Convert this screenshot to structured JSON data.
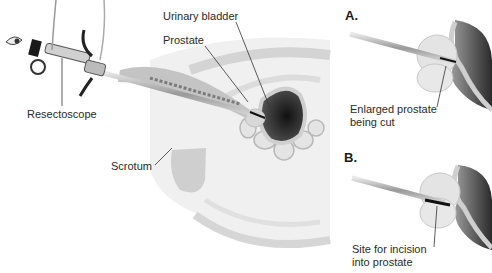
{
  "figure": {
    "main_view": {
      "labels": {
        "urinary_bladder": "Urinary bladder",
        "prostate": "Prostate",
        "resectoscope": "Resectoscope",
        "scrotum": "Scrotum"
      }
    },
    "panel_a": {
      "letter": "A.",
      "caption_line1": "Enlarged prostate",
      "caption_line2": "being cut"
    },
    "panel_b": {
      "letter": "B.",
      "caption_line1": "Site for incision",
      "caption_line2": "into prostate"
    }
  }
}
